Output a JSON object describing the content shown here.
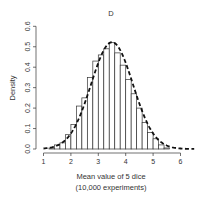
{
  "chart_data": {
    "type": "bar",
    "title": "D",
    "xlabel": "Mean value of 5 dice",
    "xlabel_sub": "(10,000 experiments)",
    "ylabel": "Density",
    "xlim": [
      1,
      6.5
    ],
    "ylim": [
      0,
      0.6
    ],
    "x_ticks": [
      1,
      2,
      3,
      4,
      5,
      6
    ],
    "y_ticks": [
      0.0,
      0.1,
      0.2,
      0.3,
      0.4,
      0.5,
      0.6
    ],
    "y_tick_labels": [
      "0.0",
      "0.1",
      "0.2",
      "0.3",
      "0.4",
      "0.5",
      "0.6"
    ],
    "bin_width": 0.2,
    "bins": [
      {
        "x0": 1.2,
        "x1": 1.4,
        "density": 0.005
      },
      {
        "x0": 1.4,
        "x1": 1.6,
        "density": 0.02
      },
      {
        "x0": 1.6,
        "x1": 1.8,
        "density": 0.03
      },
      {
        "x0": 1.8,
        "x1": 2.0,
        "density": 0.07
      },
      {
        "x0": 2.0,
        "x1": 2.2,
        "density": 0.12
      },
      {
        "x0": 2.2,
        "x1": 2.4,
        "density": 0.21
      },
      {
        "x0": 2.4,
        "x1": 2.6,
        "density": 0.25
      },
      {
        "x0": 2.6,
        "x1": 2.8,
        "density": 0.35
      },
      {
        "x0": 2.8,
        "x1": 3.0,
        "density": 0.43
      },
      {
        "x0": 3.0,
        "x1": 3.2,
        "density": 0.46
      },
      {
        "x0": 3.2,
        "x1": 3.4,
        "density": 0.49
      },
      {
        "x0": 3.4,
        "x1": 3.6,
        "density": 0.52
      },
      {
        "x0": 3.6,
        "x1": 3.8,
        "density": 0.47
      },
      {
        "x0": 3.8,
        "x1": 4.0,
        "density": 0.41
      },
      {
        "x0": 4.0,
        "x1": 4.2,
        "density": 0.34
      },
      {
        "x0": 4.2,
        "x1": 4.4,
        "density": 0.27
      },
      {
        "x0": 4.4,
        "x1": 4.6,
        "density": 0.2
      },
      {
        "x0": 4.6,
        "x1": 4.8,
        "density": 0.13
      },
      {
        "x0": 4.8,
        "x1": 5.0,
        "density": 0.08
      },
      {
        "x0": 5.0,
        "x1": 5.2,
        "density": 0.05
      },
      {
        "x0": 5.2,
        "x1": 5.4,
        "density": 0.02
      },
      {
        "x0": 5.4,
        "x1": 5.6,
        "density": 0.005
      }
    ],
    "overlay": {
      "type": "normal_density",
      "style": "dashed",
      "mean": 3.5,
      "sd": 0.764,
      "x_range": [
        1.0,
        6.5
      ]
    },
    "grid": false,
    "legend": null
  },
  "colors": {
    "bar_fill": "#ffffff",
    "bar_stroke": "#333333",
    "curve": "#111111",
    "axis": "#333333"
  }
}
